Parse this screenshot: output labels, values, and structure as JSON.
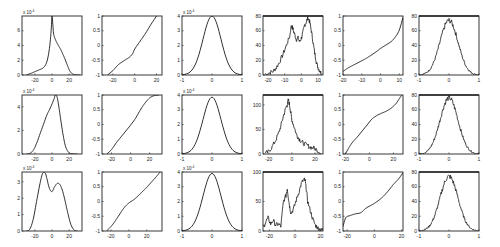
{
  "figure": {
    "rows": 3,
    "cols": 6
  },
  "chart_data": [
    {
      "id": "r1c1",
      "type": "line",
      "row": 1,
      "col": 1,
      "title": "",
      "xlabel": "",
      "ylabel": "",
      "exponent": "x 10^-4",
      "xlim": [
        -35,
        35
      ],
      "ylim": [
        0,
        8
      ],
      "xticks": [
        -20,
        0,
        20
      ],
      "yticks": [
        0,
        2,
        4,
        6
      ],
      "x": [
        -30,
        -25,
        -20,
        -15,
        -10,
        -6,
        -3,
        -1,
        0,
        1,
        2,
        4,
        6,
        8,
        10,
        12,
        15,
        18,
        21,
        24,
        28,
        33
      ],
      "y": [
        0.02,
        0.2,
        0.45,
        0.7,
        1.0,
        1.8,
        3.6,
        6.0,
        8.0,
        6.8,
        5.5,
        4.8,
        4.3,
        3.9,
        3.5,
        3.0,
        2.2,
        1.3,
        0.5,
        0.15,
        0.03,
        0.0
      ]
    },
    {
      "id": "r1c2",
      "type": "line",
      "row": 1,
      "col": 2,
      "title": "",
      "exponent": "",
      "xlim": [
        -30,
        25
      ],
      "ylim": [
        -1,
        1
      ],
      "xticks": [
        -20,
        0,
        20
      ],
      "yticks": [
        -1,
        -0.5,
        0,
        0.5,
        1
      ],
      "x": [
        -25,
        -20,
        -15,
        -10,
        -5,
        -2,
        0,
        5,
        10,
        15,
        20
      ],
      "y": [
        -1.0,
        -0.85,
        -0.65,
        -0.52,
        -0.4,
        -0.28,
        -0.12,
        0.15,
        0.42,
        0.72,
        1.0
      ]
    },
    {
      "id": "r1c3",
      "type": "line",
      "row": 1,
      "col": 3,
      "title": "",
      "exponent": "x 10^-4",
      "xlim": [
        -1,
        1
      ],
      "ylim": [
        0,
        4
      ],
      "xticks": [
        -1,
        0,
        1
      ],
      "yticks": [
        0,
        1,
        2,
        3,
        4
      ],
      "gaussian": {
        "mu": 0,
        "sigma": 0.3,
        "peak": 4.0
      }
    },
    {
      "id": "r1c4",
      "type": "line",
      "row": 1,
      "col": 4,
      "title": "",
      "exponent": "",
      "xlim": [
        -23,
        13
      ],
      "ylim": [
        0,
        80
      ],
      "xticks": [
        -20,
        -10,
        0,
        10
      ],
      "yticks": [
        0,
        20,
        40,
        60,
        80
      ],
      "x": [
        -22,
        -19,
        -17,
        -15,
        -13,
        -11,
        -9,
        -7,
        -6,
        -5,
        -4,
        -3,
        -2,
        -1,
        0,
        1,
        2,
        3,
        4,
        5,
        6,
        7,
        8,
        9,
        10,
        11,
        12
      ],
      "y": [
        1,
        3,
        5,
        10,
        18,
        28,
        40,
        52,
        68,
        62,
        55,
        48,
        50,
        45,
        50,
        58,
        68,
        72,
        78,
        72,
        60,
        45,
        30,
        18,
        10,
        6,
        2
      ],
      "noisy": true
    },
    {
      "id": "r1c5",
      "type": "line",
      "row": 1,
      "col": 5,
      "title": "",
      "exponent": "",
      "xlim": [
        -20,
        12
      ],
      "ylim": [
        -1,
        1
      ],
      "xticks": [
        -20,
        -10,
        0,
        10
      ],
      "yticks": [
        -1,
        -0.5,
        0,
        0.5,
        1
      ],
      "x": [
        -20,
        -17,
        -14,
        -11,
        -8,
        -5,
        -2,
        0,
        3,
        6,
        8,
        10,
        12
      ],
      "y": [
        -0.88,
        -0.75,
        -0.65,
        -0.55,
        -0.45,
        -0.33,
        -0.2,
        -0.1,
        0.02,
        0.15,
        0.3,
        0.52,
        0.95
      ]
    },
    {
      "id": "r1c6",
      "type": "line",
      "row": 1,
      "col": 6,
      "title": "",
      "exponent": "",
      "xlim": [
        -1,
        1
      ],
      "ylim": [
        0,
        80
      ],
      "xticks": [
        -1,
        0,
        1
      ],
      "yticks": [
        0,
        20,
        40,
        60,
        80
      ],
      "gaussian": {
        "mu": 0,
        "sigma": 0.3,
        "peak": 74
      },
      "noisy": true
    },
    {
      "id": "r2c1",
      "type": "line",
      "row": 2,
      "col": 1,
      "title": "",
      "exponent": "x 10^-4",
      "xlim": [
        -35,
        35
      ],
      "ylim": [
        0,
        5
      ],
      "xticks": [
        -20,
        0,
        20
      ],
      "yticks": [
        0,
        2,
        4
      ],
      "x": [
        -30,
        -26,
        -22,
        -18,
        -14,
        -10,
        -6,
        -2,
        2,
        4,
        6,
        8,
        10,
        13,
        16,
        20,
        24,
        30
      ],
      "y": [
        0,
        0.05,
        0.3,
        0.9,
        1.7,
        2.5,
        3.3,
        3.9,
        4.6,
        5.0,
        4.8,
        4.0,
        3.0,
        1.6,
        0.6,
        0.1,
        0.02,
        0
      ]
    },
    {
      "id": "r2c2",
      "type": "line",
      "row": 2,
      "col": 2,
      "title": "",
      "exponent": "",
      "xlim": [
        -30,
        33
      ],
      "ylim": [
        -1,
        1
      ],
      "xticks": [
        -20,
        0,
        20
      ],
      "yticks": [
        -1,
        -0.5,
        0,
        0.5,
        1
      ],
      "x": [
        -25,
        -20,
        -15,
        -10,
        -5,
        0,
        5,
        10,
        15,
        20,
        25,
        30
      ],
      "y": [
        -1.0,
        -0.85,
        -0.62,
        -0.42,
        -0.22,
        -0.02,
        0.2,
        0.48,
        0.72,
        0.9,
        0.98,
        1.0
      ]
    },
    {
      "id": "r2c3",
      "type": "line",
      "row": 2,
      "col": 3,
      "title": "",
      "exponent": "x 10^-4",
      "xlim": [
        -1,
        1
      ],
      "ylim": [
        0,
        4
      ],
      "xticks": [
        -1,
        0,
        1
      ],
      "yticks": [
        0,
        1,
        2,
        3,
        4
      ],
      "gaussian": {
        "mu": 0,
        "sigma": 0.3,
        "peak": 3.85
      }
    },
    {
      "id": "r2c4",
      "type": "line",
      "row": 2,
      "col": 4,
      "title": "",
      "exponent": "",
      "xlim": [
        -25,
        27
      ],
      "ylim": [
        0,
        120
      ],
      "xticks": [
        -20,
        0,
        20
      ],
      "yticks": [
        0,
        50,
        100
      ],
      "x": [
        -23,
        -20,
        -17,
        -14,
        -11,
        -9,
        -7,
        -5,
        -4,
        -3,
        -2,
        -1,
        0,
        2,
        4,
        6,
        8,
        10,
        13,
        16,
        19,
        22,
        25
      ],
      "y": [
        1,
        5,
        15,
        28,
        45,
        62,
        80,
        95,
        100,
        110,
        100,
        85,
        70,
        55,
        40,
        32,
        26,
        22,
        18,
        14,
        12,
        8,
        2
      ],
      "noisy": true
    },
    {
      "id": "r2c5",
      "type": "line",
      "row": 2,
      "col": 5,
      "title": "",
      "exponent": "",
      "xlim": [
        -22,
        28
      ],
      "ylim": [
        -1,
        1
      ],
      "xticks": [
        -20,
        0,
        20
      ],
      "yticks": [
        -1,
        -0.5,
        0,
        0.5,
        1
      ],
      "x": [
        -20,
        -17,
        -14,
        -10,
        -6,
        -2,
        2,
        6,
        10,
        14,
        18,
        22,
        25,
        27
      ],
      "y": [
        -1.0,
        -0.78,
        -0.6,
        -0.42,
        -0.22,
        -0.02,
        0.18,
        0.3,
        0.38,
        0.45,
        0.55,
        0.7,
        0.88,
        1.0
      ]
    },
    {
      "id": "r2c6",
      "type": "line",
      "row": 2,
      "col": 6,
      "title": "",
      "exponent": "",
      "xlim": [
        -1,
        1
      ],
      "ylim": [
        0,
        80
      ],
      "xticks": [
        -1,
        0,
        1
      ],
      "yticks": [
        0,
        20,
        40,
        60,
        80
      ],
      "gaussian": {
        "mu": 0,
        "sigma": 0.3,
        "peak": 76
      },
      "noisy": true
    },
    {
      "id": "r3c1",
      "type": "line",
      "row": 3,
      "col": 1,
      "title": "",
      "exponent": "x 10^-4",
      "xlim": [
        -35,
        35
      ],
      "ylim": [
        0,
        3.6
      ],
      "xticks": [
        -20,
        0,
        20
      ],
      "yticks": [
        0,
        1,
        2,
        3
      ],
      "x": [
        -30,
        -26,
        -22,
        -18,
        -14,
        -11,
        -8,
        -6,
        -3,
        0,
        3,
        6,
        9,
        12,
        15,
        18,
        22,
        26,
        30
      ],
      "y": [
        0,
        0.1,
        0.7,
        1.8,
        2.9,
        3.5,
        3.55,
        3.2,
        2.6,
        2.4,
        2.7,
        2.9,
        2.85,
        2.5,
        1.9,
        1.2,
        0.4,
        0.05,
        0
      ]
    },
    {
      "id": "r3c2",
      "type": "line",
      "row": 3,
      "col": 2,
      "title": "",
      "exponent": "",
      "xlim": [
        -30,
        37
      ],
      "ylim": [
        -1,
        1
      ],
      "xticks": [
        -20,
        0,
        20
      ],
      "yticks": [
        -1,
        -0.5,
        0,
        0.5,
        1
      ],
      "x": [
        -25,
        -20,
        -15,
        -10,
        -5,
        0,
        5,
        10,
        15,
        20,
        25,
        30,
        35
      ],
      "y": [
        -1.0,
        -0.85,
        -0.65,
        -0.42,
        -0.2,
        -0.05,
        0.05,
        0.18,
        0.33,
        0.48,
        0.65,
        0.82,
        1.0
      ]
    },
    {
      "id": "r3c3",
      "type": "line",
      "row": 3,
      "col": 3,
      "title": "",
      "exponent": "x 10^-4",
      "xlim": [
        -1,
        1
      ],
      "ylim": [
        0,
        4
      ],
      "xticks": [
        -1,
        0,
        1
      ],
      "yticks": [
        0,
        1,
        2,
        3,
        4
      ],
      "gaussian": {
        "mu": 0,
        "sigma": 0.3,
        "peak": 3.9
      }
    },
    {
      "id": "r3c4",
      "type": "line",
      "row": 3,
      "col": 4,
      "title": "",
      "exponent": "",
      "xlim": [
        -25,
        22
      ],
      "ylim": [
        0,
        100
      ],
      "xticks": [
        -20,
        0,
        20
      ],
      "yticks": [
        0,
        50,
        100
      ],
      "x": [
        -25,
        -23,
        -21,
        -19,
        -17,
        -15,
        -13,
        -11,
        -9,
        -7,
        -6,
        -5,
        -4,
        -3,
        -1,
        1,
        3,
        5,
        7,
        8,
        9,
        10,
        12,
        14,
        16,
        18,
        20,
        22
      ],
      "y": [
        5,
        15,
        22,
        12,
        18,
        10,
        12,
        8,
        50,
        60,
        72,
        55,
        40,
        30,
        38,
        52,
        65,
        80,
        88,
        85,
        70,
        50,
        35,
        20,
        10,
        5,
        3,
        1
      ],
      "noisy": true
    },
    {
      "id": "r3c5",
      "type": "line",
      "row": 3,
      "col": 5,
      "title": "",
      "exponent": "",
      "xlim": [
        -23,
        21
      ],
      "ylim": [
        -1,
        1
      ],
      "xticks": [
        -20,
        0,
        20
      ],
      "yticks": [
        -1,
        -0.5,
        0,
        0.5,
        1
      ],
      "x": [
        -23,
        -21,
        -18,
        -14,
        -10,
        -6,
        -2,
        2,
        6,
        10,
        14,
        18,
        21
      ],
      "y": [
        -0.85,
        -0.55,
        -0.48,
        -0.42,
        -0.38,
        -0.22,
        -0.12,
        0.0,
        0.15,
        0.35,
        0.58,
        0.78,
        0.98
      ]
    },
    {
      "id": "r3c6",
      "type": "line",
      "row": 3,
      "col": 6,
      "title": "",
      "exponent": "",
      "xlim": [
        -1,
        1
      ],
      "ylim": [
        0,
        80
      ],
      "xticks": [
        -1,
        0,
        1
      ],
      "yticks": [
        0,
        20,
        40,
        60,
        80
      ],
      "gaussian": {
        "mu": 0,
        "sigma": 0.3,
        "peak": 74
      },
      "noisy": true
    }
  ],
  "layout": {
    "col_x": [
      22,
      102,
      182,
      263,
      343,
      419
    ],
    "row_y": [
      16,
      95,
      172
    ],
    "panel_w": 60,
    "panel_h": 59
  }
}
